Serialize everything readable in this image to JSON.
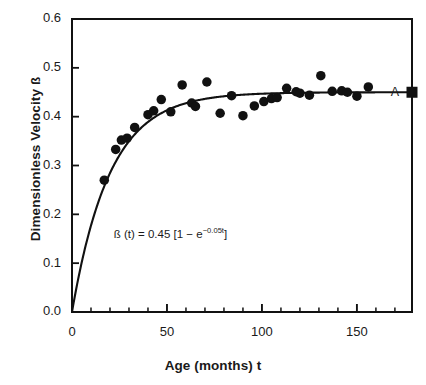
{
  "chart_data": {
    "type": "scatter",
    "title": "",
    "xlabel": "Age (months) t",
    "ylabel": "Dimensionless Velocity ß",
    "xlim": [
      0,
      179
    ],
    "ylim": [
      0.0,
      0.6
    ],
    "xticks": [
      0,
      50,
      100,
      150
    ],
    "xtick_labels": [
      "0",
      "50",
      "100",
      "150"
    ],
    "xminor_step": 10,
    "yticks": [
      0.0,
      0.1,
      0.2,
      0.3,
      0.4,
      0.5,
      0.6
    ],
    "ytick_labels": [
      "0.0",
      "0.1",
      "0.2",
      "0.3",
      "0.4",
      "0.5",
      "0.6"
    ],
    "grid": false,
    "legend": "none",
    "annotations": [
      {
        "name": "fit-equation",
        "text_parts": {
          "lead": "ß (t) = 0.45 [1 − e",
          "exponent": "−0.05t",
          "tail": "]"
        },
        "full_text": "ß (t) = 0.45 [1 − e^(−0.05t)]",
        "x": 22,
        "y": 0.158
      },
      {
        "name": "asymptote-label",
        "text": "A",
        "x": 170,
        "y": 0.45
      }
    ],
    "series": [
      {
        "name": "Observed data",
        "marker": "circle",
        "marker_color": "#111111",
        "marker_size": 9.5,
        "points": [
          {
            "x": 17,
            "y": 0.27
          },
          {
            "x": 23,
            "y": 0.333
          },
          {
            "x": 26,
            "y": 0.352
          },
          {
            "x": 29,
            "y": 0.356
          },
          {
            "x": 33,
            "y": 0.378
          },
          {
            "x": 40,
            "y": 0.404
          },
          {
            "x": 43,
            "y": 0.412
          },
          {
            "x": 47,
            "y": 0.435
          },
          {
            "x": 52,
            "y": 0.41
          },
          {
            "x": 58,
            "y": 0.465
          },
          {
            "x": 63,
            "y": 0.428
          },
          {
            "x": 65,
            "y": 0.421
          },
          {
            "x": 71,
            "y": 0.471
          },
          {
            "x": 78,
            "y": 0.407
          },
          {
            "x": 84,
            "y": 0.443
          },
          {
            "x": 90,
            "y": 0.402
          },
          {
            "x": 96,
            "y": 0.422
          },
          {
            "x": 101,
            "y": 0.431
          },
          {
            "x": 105,
            "y": 0.437
          },
          {
            "x": 108,
            "y": 0.439
          },
          {
            "x": 113,
            "y": 0.458
          },
          {
            "x": 118,
            "y": 0.451
          },
          {
            "x": 120,
            "y": 0.448
          },
          {
            "x": 125,
            "y": 0.444
          },
          {
            "x": 131,
            "y": 0.484
          },
          {
            "x": 137,
            "y": 0.452
          },
          {
            "x": 142,
            "y": 0.453
          },
          {
            "x": 145,
            "y": 0.45
          },
          {
            "x": 150,
            "y": 0.442
          },
          {
            "x": 156,
            "y": 0.461
          }
        ]
      },
      {
        "name": "Asymptote marker A",
        "marker": "square",
        "marker_color": "#111111",
        "marker_size": 11,
        "points": [
          {
            "x": 179,
            "y": 0.45
          }
        ]
      }
    ],
    "fit_curve": {
      "name": "Fitted exponential model",
      "equation": "ß(t) = 0.45 [1 − exp(−0.05 t)]",
      "amplitude": 0.45,
      "rate": 0.05,
      "color": "#111111",
      "line_width": 2.1,
      "x_start": 0,
      "x_end": 179
    }
  }
}
